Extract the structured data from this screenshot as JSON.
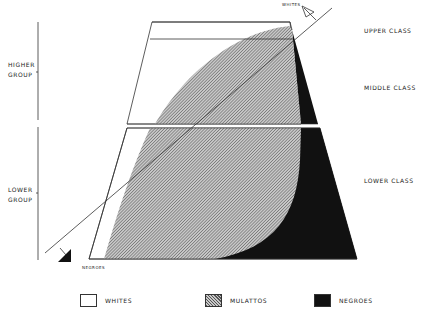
{
  "diagram": {
    "type": "social-pyramid",
    "colors": {
      "whites": "#ffffff",
      "mulattos_hatch": "#8a8a8a",
      "negroes": "#111111",
      "outline": "#333333"
    }
  },
  "groups": [
    {
      "label_line1": "HIGHER",
      "label_line2": "GROUP"
    },
    {
      "label_line1": "LOWER",
      "label_line2": "GROUP"
    }
  ],
  "classes": {
    "upper": "UPPER CLASS",
    "middle": "MIDDLE CLASS",
    "lower": "LOWER CLASS"
  },
  "arrows": {
    "whites": "WHITES",
    "negroes": "NEGROES"
  },
  "legend": [
    {
      "label": "WHITES",
      "fill": "white"
    },
    {
      "label": "MULATTOS",
      "fill": "hatched"
    },
    {
      "label": "NEGROES",
      "fill": "black"
    }
  ]
}
